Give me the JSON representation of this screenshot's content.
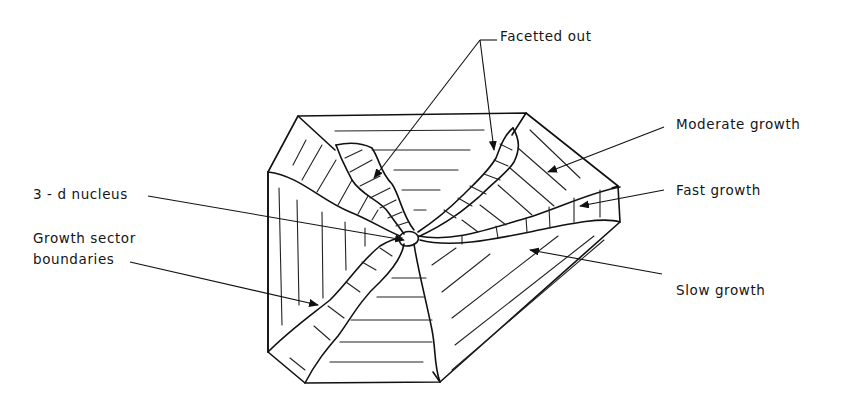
{
  "diagram": {
    "labels": {
      "facetted_out": "Facetted out",
      "moderate_growth": "Moderate growth",
      "fast_growth": "Fast growth",
      "slow_growth": "Slow growth",
      "nucleus": "3 - d nucleus",
      "growth_sector_boundaries_line1": "Growth sector",
      "growth_sector_boundaries_line2": "boundaries"
    }
  }
}
